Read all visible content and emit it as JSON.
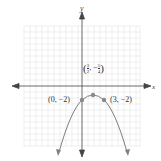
{
  "figure": {
    "axis_labels": {
      "x": "x",
      "y": "y"
    },
    "points": [
      {
        "label": "(0, −2)",
        "x": 0,
        "y": -2
      },
      {
        "label": "(3, −2)",
        "x": 3,
        "y": -2
      },
      {
        "label_num_x": "3",
        "label_den_x": "2",
        "label_num_y": "5",
        "label_den_y": "4",
        "label_sign_y": "−",
        "x": 1.5,
        "y": -1.25,
        "role": "vertex"
      }
    ],
    "curve": "y = -(x)(x-3) ... parabola opening downward through (0,-2), (3,-2) with vertex (3/2, -5/4)",
    "colors": {
      "grid": "#d9d9d9",
      "axes": "#444444",
      "curve": "#808080",
      "points": "#8a8a8a"
    }
  }
}
